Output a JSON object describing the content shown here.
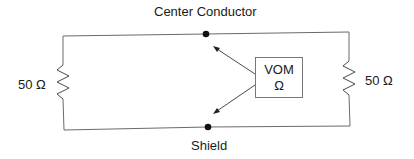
{
  "diagram": {
    "type": "circuit-schematic",
    "labels": {
      "top_node": "Center Conductor",
      "bottom_node": "Shield",
      "left_resistor": "50 Ω",
      "right_resistor": "50 Ω"
    },
    "meter": {
      "name": "VOM",
      "mode": "Ω"
    },
    "components": [
      {
        "id": "R1",
        "type": "resistor",
        "value": "50 Ω",
        "position": "left"
      },
      {
        "id": "R2",
        "type": "resistor",
        "value": "50 Ω",
        "position": "right"
      },
      {
        "id": "M1",
        "type": "meter",
        "label": "VOM",
        "unit": "Ω",
        "position": "center-right"
      }
    ],
    "nodes": [
      {
        "id": "center",
        "label": "Center Conductor"
      },
      {
        "id": "shield",
        "label": "Shield"
      }
    ],
    "connections": [
      {
        "from": "center",
        "to": "R1"
      },
      {
        "from": "R1",
        "to": "shield"
      },
      {
        "from": "center",
        "to": "R2"
      },
      {
        "from": "R2",
        "to": "shield"
      },
      {
        "from": "M1",
        "to": "center",
        "style": "arrow"
      },
      {
        "from": "M1",
        "to": "shield",
        "style": "arrow"
      }
    ],
    "colors": {
      "line": "#6a6a6a",
      "node": "#111111",
      "text": "#1a1a1a",
      "background": "#ffffff"
    }
  }
}
